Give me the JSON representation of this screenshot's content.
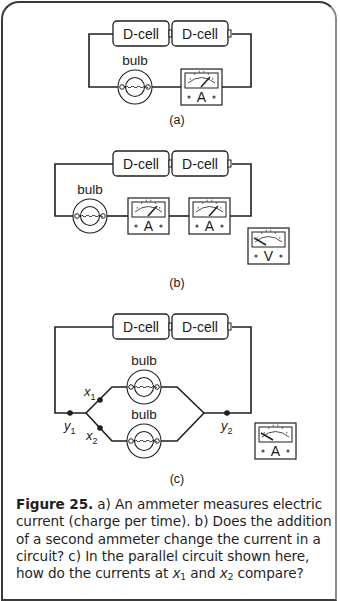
{
  "figure": {
    "panels": [
      {
        "id": "a",
        "label": "(a)",
        "cells": [
          "D-cell",
          "D-cell"
        ],
        "bulbs": [
          "bulb"
        ],
        "meters": [
          {
            "type": "ammeter",
            "symbol": "A",
            "in_circuit": true
          }
        ]
      },
      {
        "id": "b",
        "label": "(b)",
        "cells": [
          "D-cell",
          "D-cell"
        ],
        "bulbs": [
          "bulb"
        ],
        "meters": [
          {
            "type": "ammeter",
            "symbol": "A",
            "in_circuit": true
          },
          {
            "type": "ammeter",
            "symbol": "A",
            "in_circuit": true
          },
          {
            "type": "voltmeter",
            "symbol": "V",
            "in_circuit": false
          }
        ]
      },
      {
        "id": "c",
        "label": "(c)",
        "cells": [
          "D-cell",
          "D-cell"
        ],
        "bulbs": [
          "bulb",
          "bulb"
        ],
        "points": [
          {
            "name": "x",
            "sub": "1"
          },
          {
            "name": "x",
            "sub": "2"
          },
          {
            "name": "y",
            "sub": "1"
          },
          {
            "name": "y",
            "sub": "2"
          }
        ],
        "meters": [
          {
            "type": "ammeter",
            "symbol": "A",
            "in_circuit": false
          }
        ]
      }
    ],
    "caption": {
      "number": "Figure 25.",
      "part_a": " a) An ammeter measures electric current (charge per time). b) Does the addition of a second ammeter change the current in a circuit? c) In the parallel circuit shown here, how do the currents at ",
      "x1_var": "x",
      "x1_sub": "1",
      "mid": " and ",
      "x2_var": "x",
      "x2_sub": "2",
      "end": " compare?"
    }
  }
}
